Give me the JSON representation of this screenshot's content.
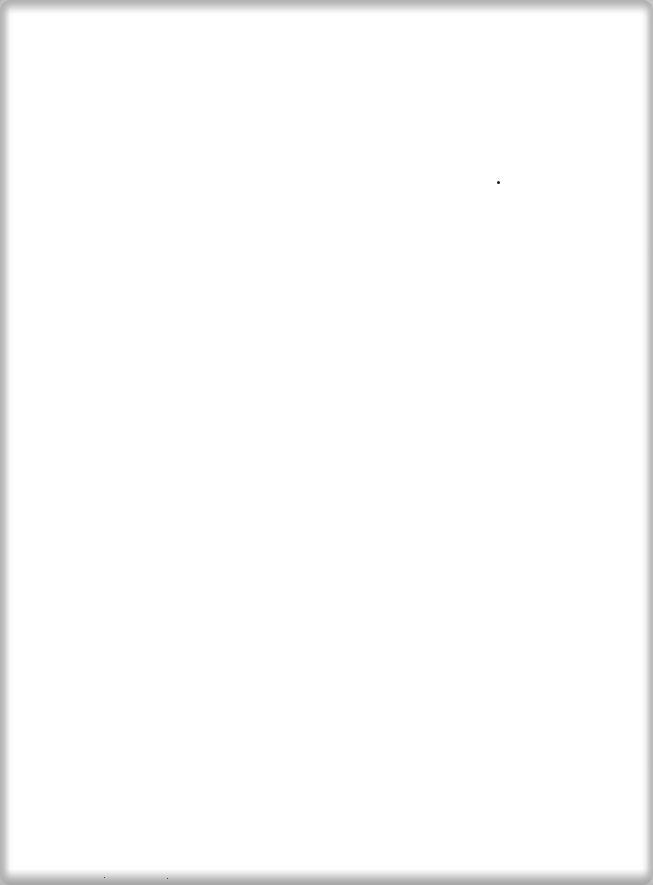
{
  "document": {
    "content": "",
    "background_color": "#ffffff",
    "edge_shadow_color": "#a8a8a8"
  },
  "artifacts": [
    {
      "name": "speck",
      "x": 498,
      "y": 182,
      "size": 3
    },
    {
      "name": "speck",
      "x": 104,
      "y": 877,
      "size": 1
    },
    {
      "name": "speck",
      "x": 167,
      "y": 878,
      "size": 1
    }
  ]
}
